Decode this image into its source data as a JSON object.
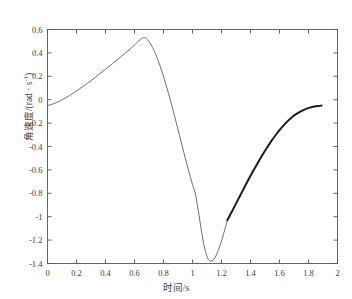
{
  "figure": {
    "header_text": "",
    "background": "#ffffff"
  },
  "axes": {
    "x_label": "时间/s",
    "y_label_main": "角速度/(rad · s",
    "y_label_exp": "-1",
    "y_label_tail": ")",
    "x_ticks": [
      "0",
      "0.2",
      "0.4",
      "0.6",
      "0.8",
      "1",
      "1.2",
      "1.4",
      "1.6",
      "1.8",
      "2"
    ],
    "y_ticks": [
      "0.6",
      "0.4",
      "0.2",
      "0",
      "-0.2",
      "-0.4",
      "-0.6",
      "-0.8",
      "-1",
      "-1.2",
      "-1.4"
    ],
    "frame_color": "#555555",
    "tick_color": "#555555"
  },
  "chart_data": {
    "type": "line",
    "title": "",
    "xlabel": "时间/s",
    "ylabel": "角速度/(rad · s⁻¹)",
    "xlim": [
      0,
      2
    ],
    "ylim": [
      -1.4,
      0.6
    ],
    "xticks": [
      0,
      0.2,
      0.4,
      0.6,
      0.8,
      1,
      1.2,
      1.4,
      1.6,
      1.8,
      2
    ],
    "yticks": [
      0.6,
      0.4,
      0.2,
      0,
      -0.2,
      -0.4,
      -0.6,
      -0.8,
      -1,
      -1.2,
      -1.4
    ],
    "grid": false,
    "legend": null,
    "series": [
      {
        "name": "角速度",
        "color": "#6e6e6e",
        "width": 1.0,
        "x": [
          0.0,
          0.03,
          0.06,
          0.09,
          0.12,
          0.15,
          0.18,
          0.21,
          0.24,
          0.27,
          0.3,
          0.33,
          0.36,
          0.39,
          0.42,
          0.45,
          0.48,
          0.51,
          0.54,
          0.57,
          0.6,
          0.62,
          0.64,
          0.655,
          0.665,
          0.675,
          0.69,
          0.71,
          0.73,
          0.76,
          0.79,
          0.82,
          0.85,
          0.88,
          0.91,
          0.94,
          0.97,
          1.0,
          1.02,
          1.04,
          1.06,
          1.08,
          1.1,
          1.12,
          1.15,
          1.18,
          1.21,
          1.24
        ],
        "y": [
          -0.05,
          -0.04,
          -0.025,
          -0.008,
          0.012,
          0.034,
          0.058,
          0.083,
          0.109,
          0.136,
          0.164,
          0.192,
          0.221,
          0.25,
          0.28,
          0.31,
          0.34,
          0.371,
          0.402,
          0.434,
          0.468,
          0.491,
          0.514,
          0.527,
          0.531,
          0.528,
          0.512,
          0.478,
          0.432,
          0.344,
          0.238,
          0.117,
          -0.016,
          -0.158,
          -0.304,
          -0.45,
          -0.592,
          -0.725,
          -0.806,
          -0.948,
          -1.11,
          -1.248,
          -1.34,
          -1.379,
          -1.36,
          -1.28,
          -1.165,
          -1.03
        ]
      },
      {
        "name": "角速度 (加粗段)",
        "color": "#1c1c1c",
        "width": 2.0,
        "x": [
          1.24,
          1.27,
          1.3,
          1.33,
          1.36,
          1.39,
          1.42,
          1.45,
          1.48,
          1.51,
          1.54,
          1.57,
          1.6,
          1.63,
          1.66,
          1.69,
          1.72,
          1.75,
          1.78,
          1.81,
          1.84,
          1.87,
          1.89
        ],
        "y": [
          -1.03,
          -0.96,
          -0.888,
          -0.816,
          -0.744,
          -0.674,
          -0.606,
          -0.54,
          -0.477,
          -0.417,
          -0.36,
          -0.308,
          -0.26,
          -0.217,
          -0.179,
          -0.146,
          -0.119,
          -0.097,
          -0.08,
          -0.068,
          -0.059,
          -0.053,
          -0.05
        ]
      }
    ]
  }
}
